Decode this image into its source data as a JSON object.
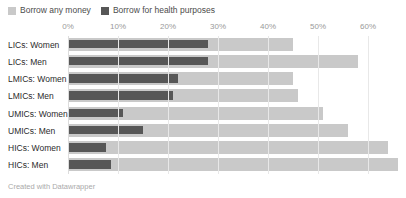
{
  "legend": {
    "position": "top-left",
    "items": [
      {
        "label": "Borrow any money",
        "color": "#c9c9c9",
        "swatch_icon": "square-swatch"
      },
      {
        "label": "Borrow for health purposes",
        "color": "#575757",
        "swatch_icon": "square-swatch"
      }
    ]
  },
  "footer": {
    "credit": "Created with Datawrapper"
  },
  "axis": {
    "ticks": [
      "0%",
      "10%",
      "20%",
      "30%",
      "40%",
      "50%",
      "60%"
    ]
  },
  "chart_data": {
    "type": "bar",
    "orientation": "horizontal",
    "title": "",
    "subtitle": "",
    "xlabel": "",
    "ylabel": "",
    "xlim": [
      0,
      67.6
    ],
    "xticks": [
      0,
      10,
      20,
      30,
      40,
      50,
      60
    ],
    "xtick_labels": [
      "0%",
      "10%",
      "20%",
      "30%",
      "40%",
      "50%",
      "60%"
    ],
    "grid": "vertical",
    "legend_position": "top-left",
    "overlay": true,
    "categories": [
      "LICs: Women",
      "LICs: Men",
      "LMICs: Women",
      "LMICs: Men",
      "UMICs: Women",
      "UMICs: Men",
      "HICs: Women",
      "HICs: Men"
    ],
    "series": [
      {
        "name": "Borrow any money",
        "color": "#c9c9c9",
        "values": [
          45,
          58,
          45,
          46,
          51,
          56,
          64,
          66
        ]
      },
      {
        "name": "Borrow for health purposes",
        "color": "#575757",
        "values": [
          28,
          28,
          22,
          21,
          11,
          15,
          7.5,
          8.5
        ]
      }
    ]
  }
}
